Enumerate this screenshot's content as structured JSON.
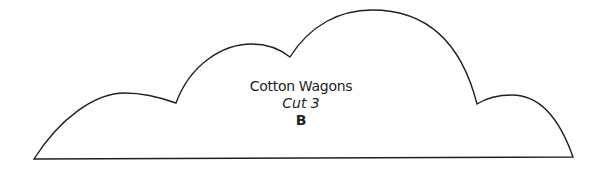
{
  "shape": {
    "type": "cloud-outline",
    "stroke_color": "#231f20",
    "fill_color": "#ffffff",
    "stroke_width": 1.4
  },
  "labels": {
    "title": "Cotton Wagons",
    "cut": "Cut 3",
    "letter": "B"
  }
}
